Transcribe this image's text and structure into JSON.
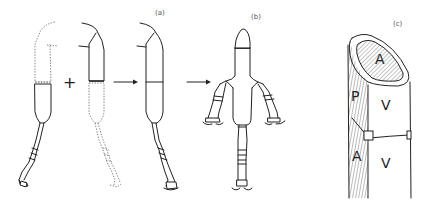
{
  "figure": {
    "panels": [
      {
        "id": "a",
        "label": "(a)",
        "description": "Two partial limbs (one drawn dotted distal, one dotted proximal) combined to form a complete limb"
      },
      {
        "id": "b",
        "label": "(b)",
        "description": "Resulting supernumerary limb structure with three distal outgrowths"
      },
      {
        "id": "c",
        "label": "(c)",
        "description": "Cylindrical limb segment showing anterior/posterior/ventral axis labels"
      }
    ],
    "operators": {
      "plus": "+",
      "arrow1": "→",
      "arrow2": "→"
    },
    "panel_c_labels": {
      "top_cut_face": "A",
      "upper_left": "P",
      "upper_right": "V",
      "lower_left": "A",
      "lower_right": "V"
    },
    "colors": {
      "line": "#222222",
      "background": "#ffffff",
      "hatch": "#555555"
    }
  }
}
